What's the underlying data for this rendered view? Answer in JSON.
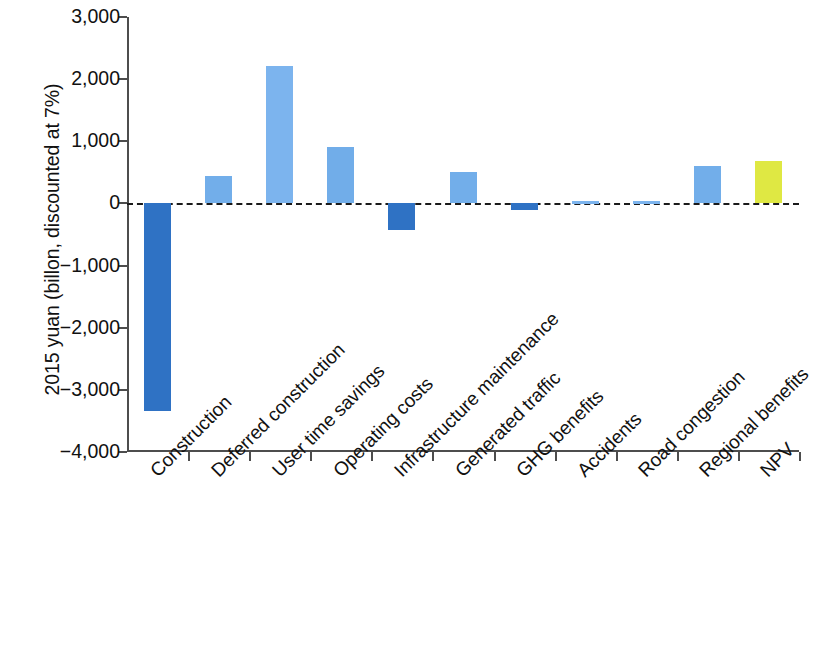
{
  "chart_data": {
    "type": "bar",
    "title": "",
    "xlabel": "",
    "ylabel": "2015 yuan (billon, discounted at 7%)",
    "ylim": [
      -4000,
      3000
    ],
    "ytick_labels": [
      "3,000",
      "2,000",
      "1,000",
      "0",
      "−1,000",
      "−2,000",
      "−3,000",
      "−4,000"
    ],
    "ytick_values": [
      3000,
      2000,
      1000,
      0,
      -1000,
      -2000,
      -3000,
      -4000
    ],
    "grid": false,
    "legend": "none",
    "zero_reference_line": true,
    "categories": [
      "Construction",
      "Deferred construction",
      "User time savings",
      "Operating costs",
      "Infrastructure maintenance",
      "Generated traffic",
      "GHG benefits",
      "Accidents",
      "Road congestion",
      "Regional benefits",
      "NPV"
    ],
    "values": [
      -3340,
      440,
      2210,
      910,
      -430,
      500,
      -110,
      40,
      40,
      600,
      680
    ],
    "bar_colors": [
      "#2f72c4",
      "#72aeea",
      "#7cb4ee",
      "#71ade9",
      "#2f72c4",
      "#72aeea",
      "#2f72c4",
      "#7cb4ee",
      "#7cb4ee",
      "#72aeea",
      "#dfe843"
    ],
    "colors": {
      "negative": "#2f72c4",
      "positive": "#72aeea",
      "total": "#dfe843",
      "axis": "#4d4d4d",
      "text": "#111111",
      "background": "#ffffff"
    }
  }
}
